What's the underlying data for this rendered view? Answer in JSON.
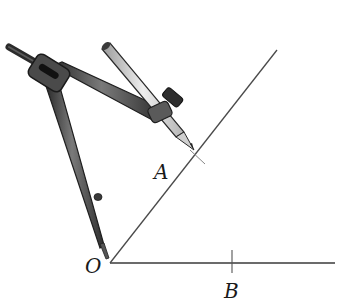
{
  "figure": {
    "labels": {
      "O": "O",
      "A": "A",
      "B": "B"
    },
    "points": {
      "O": [
        110,
        263
      ],
      "A": [
        196,
        155
      ],
      "B": [
        232,
        263
      ]
    },
    "rays": [
      {
        "name": "ray-OB",
        "from": [
          110,
          263
        ],
        "to": [
          335,
          263
        ]
      },
      {
        "name": "ray-OA",
        "from": [
          110,
          263
        ],
        "to": [
          277,
          50
        ]
      }
    ],
    "colors": {
      "line": "#3a3a3a",
      "compass_dark": "#3c3c3c",
      "compass_mid": "#6a6a6a",
      "pencil": "#d9d9d9"
    }
  }
}
